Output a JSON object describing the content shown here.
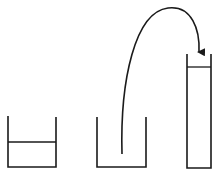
{
  "diagram": {
    "colors": {
      "stroke": "#1a1a1a",
      "background": "#ffffff"
    },
    "containers": [
      {
        "name": "left-beaker",
        "state": "partially filled"
      },
      {
        "name": "middle-beaker",
        "state": "empty"
      },
      {
        "name": "tall-tube",
        "state": "filled near top"
      }
    ],
    "arrow": {
      "from": "middle-beaker",
      "to": "tall-tube"
    }
  }
}
